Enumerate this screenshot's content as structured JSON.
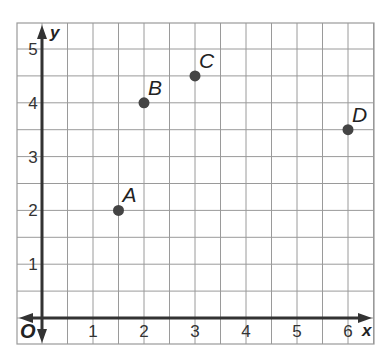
{
  "chart_data": {
    "type": "scatter",
    "title": "",
    "xlabel": "x",
    "ylabel": "y",
    "origin_label": "O",
    "xlim": [
      -1,
      6.5
    ],
    "ylim": [
      -0.5,
      5.5
    ],
    "grid": true,
    "grid_step": 0.5,
    "x_ticks": [
      1,
      2,
      3,
      4,
      5,
      6
    ],
    "y_ticks": [
      1,
      2,
      3,
      4,
      5
    ],
    "points": [
      {
        "label": "A",
        "x": 1.5,
        "y": 2
      },
      {
        "label": "B",
        "x": 2,
        "y": 4
      },
      {
        "label": "C",
        "x": 3,
        "y": 4.5
      },
      {
        "label": "D",
        "x": 6,
        "y": 3.5
      }
    ],
    "colors": {
      "grid": "#9a9a9a",
      "axis": "#333333",
      "point": "#444444"
    }
  }
}
